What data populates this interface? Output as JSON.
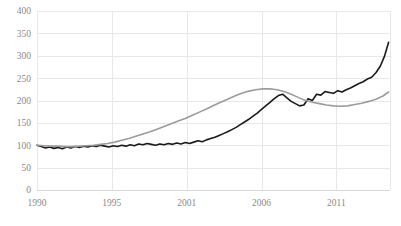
{
  "chart_data": {
    "type": "line",
    "title": "",
    "xlabel": "",
    "ylabel": "",
    "ylim": [
      0,
      400
    ],
    "xlim": [
      1990,
      2015
    ],
    "grid": true,
    "legend": "none",
    "ytick_labels": [
      "0",
      "50",
      "100",
      "150",
      "200",
      "250",
      "300",
      "350",
      "400"
    ],
    "ytick_values": [
      0,
      50,
      100,
      150,
      200,
      250,
      300,
      350,
      400
    ],
    "xtick_labels": [
      "1990",
      "1995",
      "2001",
      "2006",
      "2011"
    ],
    "xtick_values": [
      1990,
      1995.3,
      2000.6,
      2005.9,
      2011.2
    ],
    "colors": {
      "series_black": "#1a1a1a",
      "series_gray": "#9c9c9c",
      "grid": "#e8e8ec",
      "axis": "#d9d9dd",
      "tick_text": "#8a8a8a"
    },
    "series": [
      {
        "name": "black-series",
        "color": "#1a1a1a",
        "width": 1.6,
        "x": [
          1990.0,
          1990.3,
          1990.6,
          1990.9,
          1991.2,
          1991.5,
          1991.8,
          1992.1,
          1992.4,
          1992.7,
          1993.0,
          1993.3,
          1993.6,
          1993.9,
          1994.2,
          1994.5,
          1994.8,
          1995.1,
          1995.4,
          1995.7,
          1996.0,
          1996.3,
          1996.6,
          1996.9,
          1997.2,
          1997.5,
          1997.8,
          1998.1,
          1998.4,
          1998.7,
          1999.0,
          1999.3,
          1999.6,
          1999.9,
          2000.2,
          2000.5,
          2000.8,
          2001.1,
          2001.4,
          2001.7,
          2002.0,
          2002.3,
          2002.6,
          2002.9,
          2003.2,
          2003.5,
          2003.8,
          2004.1,
          2004.4,
          2004.7,
          2005.0,
          2005.3,
          2005.6,
          2005.9,
          2006.2,
          2006.5,
          2006.8,
          2007.1,
          2007.4,
          2007.7,
          2008.0,
          2008.3,
          2008.6,
          2008.9,
          2009.2,
          2009.5,
          2009.8,
          2010.1,
          2010.4,
          2010.7,
          2011.0,
          2011.3,
          2011.6,
          2011.9,
          2012.2,
          2012.5,
          2012.8,
          2013.1,
          2013.4,
          2013.7,
          2014.0,
          2014.3,
          2014.6,
          2014.9
        ],
        "y": [
          100,
          97,
          94,
          96,
          93,
          95,
          92,
          96,
          94,
          97,
          95,
          98,
          96,
          99,
          97,
          100,
          98,
          96,
          99,
          97,
          100,
          98,
          101,
          99,
          103,
          101,
          104,
          102,
          100,
          103,
          101,
          104,
          102,
          105,
          103,
          106,
          104,
          107,
          110,
          108,
          112,
          115,
          118,
          122,
          126,
          130,
          135,
          140,
          146,
          152,
          158,
          165,
          172,
          180,
          188,
          196,
          204,
          211,
          214,
          206,
          198,
          193,
          188,
          190,
          204,
          200,
          214,
          212,
          220,
          218,
          216,
          222,
          219,
          224,
          228,
          233,
          238,
          242,
          248,
          252,
          262,
          276,
          298,
          330
        ]
      },
      {
        "name": "gray-series",
        "color": "#9c9c9c",
        "width": 1.6,
        "x": [
          1990.0,
          1990.5,
          1991.0,
          1991.5,
          1992.0,
          1992.5,
          1993.0,
          1993.5,
          1994.0,
          1994.5,
          1995.0,
          1995.5,
          1996.0,
          1996.5,
          1997.0,
          1997.5,
          1998.0,
          1998.5,
          1999.0,
          1999.5,
          2000.0,
          2000.5,
          2001.0,
          2001.5,
          2002.0,
          2002.5,
          2003.0,
          2003.5,
          2004.0,
          2004.5,
          2005.0,
          2005.5,
          2006.0,
          2006.5,
          2007.0,
          2007.5,
          2008.0,
          2008.5,
          2009.0,
          2009.5,
          2010.0,
          2010.5,
          2011.0,
          2011.5,
          2012.0,
          2012.5,
          2013.0,
          2013.5,
          2014.0,
          2014.5,
          2014.9
        ],
        "y": [
          100,
          99,
          98,
          98,
          97,
          97,
          98,
          99,
          100,
          102,
          104,
          107,
          111,
          115,
          120,
          125,
          130,
          136,
          142,
          148,
          154,
          160,
          167,
          174,
          181,
          189,
          196,
          203,
          210,
          216,
          221,
          224,
          226,
          226,
          224,
          220,
          214,
          207,
          200,
          196,
          193,
          190,
          188,
          187,
          188,
          191,
          194,
          198,
          203,
          210,
          219
        ]
      }
    ]
  }
}
